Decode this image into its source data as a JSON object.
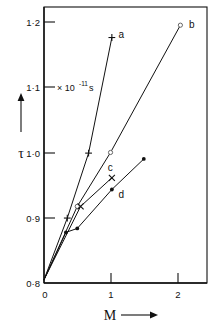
{
  "chart_data": {
    "type": "line",
    "title": "",
    "xlabel": "M",
    "ylabel": "τ",
    "y_unit_annotation": "× 10",
    "y_unit_exponent": "-11",
    "y_unit_suffix": "s",
    "xlim": [
      0,
      2.45
    ],
    "ylim": [
      0.8,
      1.225
    ],
    "grid": false,
    "legend": "inline-curve-labels",
    "xticks": [
      0,
      1,
      2
    ],
    "xticklabels": [
      "0",
      "1",
      "2"
    ],
    "yticks": [
      0.8,
      0.9,
      1.0,
      1.1,
      1.2
    ],
    "yticklabels": [
      "0·8",
      "0·9",
      "1·0",
      "1·1",
      "1·2"
    ],
    "x_axis_arrow": true,
    "y_axis_arrow": true,
    "series": [
      {
        "name": "a",
        "label": "a",
        "marker": "plus",
        "x": [
          0,
          0.35,
          0.67,
          1.02
        ],
        "y": [
          0.805,
          0.9,
          1.0,
          1.178
        ],
        "label_x": 1.12,
        "label_y": 1.183
      },
      {
        "name": "b",
        "label": "b",
        "marker": "open-circle",
        "x": [
          0,
          0.5,
          1.0,
          2.05
        ],
        "y": [
          0.805,
          0.918,
          1.001,
          1.197
        ],
        "label_x": 2.18,
        "label_y": 1.198
      },
      {
        "name": "c",
        "label": "c",
        "marker": "cross",
        "x": [
          0,
          0.55,
          1.02
        ],
        "y": [
          0.805,
          0.918,
          0.962
        ],
        "label_x": 0.96,
        "label_y": 0.978
      },
      {
        "name": "d",
        "label": "d",
        "marker": "filled-circle",
        "x": [
          0,
          0.33,
          0.5,
          1.02,
          1.5
        ],
        "y": [
          0.805,
          0.878,
          0.884,
          0.944,
          0.991
        ],
        "label_x": 1.12,
        "label_y": 0.936
      }
    ]
  },
  "axes": {
    "x_title": "M",
    "y_title": "τ"
  }
}
